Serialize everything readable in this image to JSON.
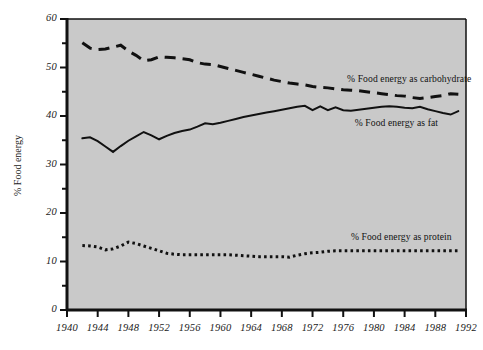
{
  "chart_data": {
    "type": "line",
    "title": "",
    "subtitle": "",
    "xlabel": "",
    "ylabel": "% Food energy",
    "xlim": [
      1940,
      1992
    ],
    "ylim": [
      0,
      60
    ],
    "grid": false,
    "legend_position": "inline-annotations",
    "background_color": "#c9c9c9",
    "line_color": "#111111",
    "x_ticks": [
      1940,
      1944,
      1948,
      1952,
      1956,
      1960,
      1964,
      1968,
      1972,
      1976,
      1980,
      1984,
      1988,
      1992
    ],
    "x_tick_labels": [
      "1940",
      "1944",
      "1948",
      "1952",
      "1956",
      "1960",
      "1964",
      "1968",
      "1972",
      "1976",
      "1980",
      "1984",
      "1988",
      "1992"
    ],
    "x_minor_ticks": [
      1942,
      1946,
      1950,
      1954,
      1958,
      1962,
      1966,
      1970,
      1974,
      1978,
      1982,
      1986,
      1990
    ],
    "y_ticks": [
      0,
      10,
      20,
      30,
      40,
      50,
      60
    ],
    "y_tick_labels": [
      "0",
      "10",
      "20",
      "30",
      "40",
      "50",
      "60"
    ],
    "y_minor_ticks": [
      5,
      15,
      25,
      35,
      45,
      55
    ],
    "series": [
      {
        "name": "% Food energy as carbohydrate",
        "style": "dashed",
        "annotation": "% Food energy as carbohydrate",
        "annotation_x": 1976.5,
        "annotation_y": 47.6,
        "x": [
          1942,
          1943,
          1944,
          1945,
          1946,
          1947,
          1948,
          1949,
          1950,
          1951,
          1952,
          1953,
          1954,
          1955,
          1956,
          1957,
          1958,
          1959,
          1960,
          1961,
          1962,
          1963,
          1964,
          1965,
          1966,
          1967,
          1968,
          1969,
          1970,
          1971,
          1972,
          1973,
          1974,
          1975,
          1976,
          1977,
          1978,
          1979,
          1980,
          1981,
          1982,
          1983,
          1984,
          1985,
          1986,
          1987,
          1988,
          1989,
          1990,
          1991
        ],
        "y": [
          55.1,
          54.0,
          53.7,
          53.8,
          54.2,
          54.6,
          53.4,
          52.5,
          51.4,
          51.6,
          52.2,
          52.1,
          52.0,
          51.8,
          51.6,
          51.0,
          50.7,
          50.6,
          50.2,
          49.8,
          49.4,
          49.0,
          48.6,
          48.2,
          47.8,
          47.4,
          47.1,
          46.8,
          46.6,
          46.4,
          46.1,
          45.9,
          45.8,
          45.6,
          45.4,
          45.3,
          45.2,
          45.0,
          44.8,
          44.6,
          44.4,
          44.2,
          44.1,
          43.8,
          43.6,
          43.8,
          44.0,
          44.2,
          44.6,
          44.5
        ]
      },
      {
        "name": "% Food energy as fat",
        "style": "solid",
        "annotation": "% Food energy as  fat",
        "annotation_x": 1977.5,
        "annotation_y": 38.6,
        "x": [
          1942,
          1943,
          1944,
          1945,
          1946,
          1947,
          1948,
          1949,
          1950,
          1951,
          1952,
          1953,
          1954,
          1955,
          1956,
          1957,
          1958,
          1959,
          1960,
          1961,
          1962,
          1963,
          1964,
          1965,
          1966,
          1967,
          1968,
          1969,
          1970,
          1971,
          1972,
          1973,
          1974,
          1975,
          1976,
          1977,
          1978,
          1979,
          1980,
          1981,
          1982,
          1983,
          1984,
          1985,
          1986,
          1987,
          1988,
          1989,
          1990,
          1991
        ],
        "y": [
          35.4,
          35.6,
          34.8,
          33.7,
          32.6,
          33.8,
          34.9,
          35.8,
          36.7,
          36.0,
          35.2,
          35.9,
          36.5,
          36.9,
          37.2,
          37.8,
          38.5,
          38.3,
          38.6,
          39.0,
          39.4,
          39.8,
          40.1,
          40.4,
          40.7,
          41.0,
          41.3,
          41.6,
          41.9,
          42.1,
          41.2,
          42.0,
          41.2,
          41.8,
          41.2,
          41.1,
          41.3,
          41.5,
          41.7,
          41.9,
          42.0,
          41.9,
          41.7,
          41.6,
          41.9,
          41.4,
          41.0,
          40.6,
          40.3,
          41.0
        ]
      },
      {
        "name": "% Food energy as protein",
        "style": "dotted",
        "annotation": "% Food energy as protein",
        "annotation_x": 1977.0,
        "annotation_y": 15.0,
        "x": [
          1942,
          1943,
          1944,
          1945,
          1946,
          1947,
          1948,
          1949,
          1950,
          1951,
          1952,
          1953,
          1954,
          1955,
          1956,
          1957,
          1958,
          1959,
          1960,
          1961,
          1962,
          1963,
          1964,
          1965,
          1966,
          1967,
          1968,
          1969,
          1970,
          1971,
          1972,
          1973,
          1974,
          1975,
          1976,
          1977,
          1978,
          1979,
          1980,
          1981,
          1982,
          1983,
          1984,
          1985,
          1986,
          1987,
          1988,
          1989,
          1990,
          1991
        ],
        "y": [
          13.3,
          13.2,
          13.0,
          12.4,
          12.6,
          13.2,
          14.0,
          13.7,
          13.2,
          12.7,
          12.2,
          11.7,
          11.5,
          11.4,
          11.4,
          11.4,
          11.4,
          11.4,
          11.4,
          11.4,
          11.3,
          11.2,
          11.1,
          11.0,
          11.0,
          11.0,
          11.0,
          10.9,
          11.3,
          11.6,
          11.8,
          11.9,
          12.1,
          12.2,
          12.2,
          12.2,
          12.2,
          12.2,
          12.2,
          12.2,
          12.2,
          12.2,
          12.2,
          12.2,
          12.2,
          12.2,
          12.2,
          12.2,
          12.2,
          12.2
        ]
      }
    ]
  }
}
